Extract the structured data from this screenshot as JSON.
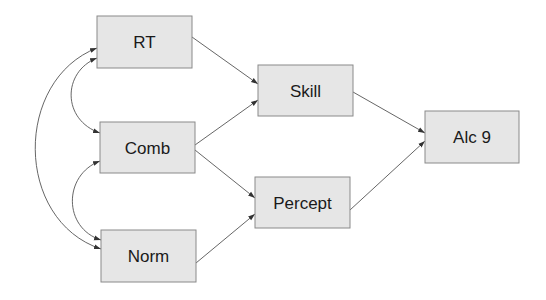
{
  "diagram": {
    "type": "path-diagram",
    "colors": {
      "node_fill": "#e6e6e6",
      "node_border": "#8a8a8a",
      "edge": "#555555",
      "text": "#1a1a1a"
    },
    "nodes": [
      {
        "id": "rt",
        "label": "RT",
        "x": 97,
        "y": 16,
        "w": 95,
        "h": 52
      },
      {
        "id": "comb",
        "label": "Comb",
        "x": 100,
        "y": 122,
        "w": 95,
        "h": 51
      },
      {
        "id": "norm",
        "label": "Norm",
        "x": 101,
        "y": 230,
        "w": 95,
        "h": 52
      },
      {
        "id": "skill",
        "label": "Skill",
        "x": 258,
        "y": 65,
        "w": 95,
        "h": 51
      },
      {
        "id": "percept",
        "label": "Percept",
        "x": 255,
        "y": 177,
        "w": 95,
        "h": 51
      },
      {
        "id": "alc9",
        "label": "Alc 9",
        "x": 425,
        "y": 111,
        "w": 94,
        "h": 52
      }
    ],
    "edges": [
      {
        "from": "RT",
        "to": "Skill",
        "type": "directed"
      },
      {
        "from": "Comb",
        "to": "Skill",
        "type": "directed"
      },
      {
        "from": "Comb",
        "to": "Percept",
        "type": "directed"
      },
      {
        "from": "Norm",
        "to": "Percept",
        "type": "directed"
      },
      {
        "from": "Skill",
        "to": "Alc 9",
        "type": "directed"
      },
      {
        "from": "Percept",
        "to": "Alc 9",
        "type": "directed"
      },
      {
        "from": "RT",
        "to": "Comb",
        "type": "covariance"
      },
      {
        "from": "Comb",
        "to": "Norm",
        "type": "covariance"
      },
      {
        "from": "RT",
        "to": "Norm",
        "type": "covariance"
      }
    ]
  }
}
